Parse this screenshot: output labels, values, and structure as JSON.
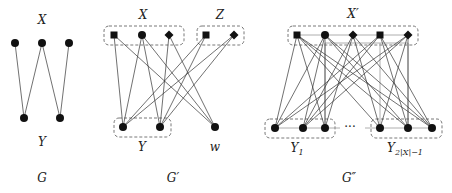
{
  "diagram": {
    "panels": [
      {
        "id": "G",
        "caption": "G",
        "set_labels": {
          "top": "X",
          "bottom": "Y"
        },
        "top_nodes": [
          {
            "x": 15,
            "y": 43,
            "shape": "circle"
          },
          {
            "x": 42,
            "y": 43,
            "shape": "circle"
          },
          {
            "x": 69,
            "y": 43,
            "shape": "circle"
          }
        ],
        "bottom_nodes": [
          {
            "x": 24,
            "y": 118,
            "shape": "circle"
          },
          {
            "x": 60,
            "y": 118,
            "shape": "circle"
          }
        ],
        "edges": [
          [
            0,
            0
          ],
          [
            1,
            0
          ],
          [
            1,
            1
          ],
          [
            2,
            1
          ]
        ]
      },
      {
        "id": "G-prime",
        "caption": "G′",
        "set_labels": {
          "X": "X",
          "Z": "Z",
          "Y": "Y",
          "w": "w"
        },
        "top_nodes": [
          {
            "x": 114,
            "y": 35,
            "shape": "square"
          },
          {
            "x": 142,
            "y": 35,
            "shape": "circle"
          },
          {
            "x": 169,
            "y": 35,
            "shape": "diamond"
          },
          {
            "x": 206,
            "y": 35,
            "shape": "square"
          },
          {
            "x": 234,
            "y": 35,
            "shape": "diamond"
          }
        ],
        "bottom_nodes": [
          {
            "x": 123,
            "y": 127,
            "shape": "circle"
          },
          {
            "x": 160,
            "y": 127,
            "shape": "circle"
          },
          {
            "x": 215,
            "y": 127,
            "shape": "circle"
          }
        ],
        "edges": [
          [
            0,
            0
          ],
          [
            0,
            2
          ],
          [
            1,
            0
          ],
          [
            1,
            1
          ],
          [
            1,
            2
          ],
          [
            2,
            1
          ],
          [
            2,
            2
          ],
          [
            3,
            0
          ],
          [
            3,
            1
          ],
          [
            4,
            0
          ],
          [
            4,
            1
          ]
        ]
      },
      {
        "id": "G-double-prime",
        "caption": "G″",
        "set_labels": {
          "top": "X′",
          "bottom_left": "Y",
          "bottom_left_sub": "1",
          "bottom_right": "Y",
          "bottom_right_sub": "2|X|−1",
          "ellipsis": "···"
        },
        "top_nodes": [
          {
            "x": 297,
            "y": 35,
            "shape": "square"
          },
          {
            "x": 325,
            "y": 35,
            "shape": "circle"
          },
          {
            "x": 353,
            "y": 35,
            "shape": "diamond"
          },
          {
            "x": 380,
            "y": 35,
            "shape": "square"
          },
          {
            "x": 408,
            "y": 35,
            "shape": "diamond"
          }
        ],
        "bottom_nodes": [
          {
            "x": 275,
            "y": 128,
            "shape": "circle"
          },
          {
            "x": 303,
            "y": 128,
            "shape": "circle"
          },
          {
            "x": 325,
            "y": 128,
            "shape": "circle"
          },
          {
            "x": 380,
            "y": 128,
            "shape": "circle"
          },
          {
            "x": 408,
            "y": 128,
            "shape": "circle"
          },
          {
            "x": 432,
            "y": 128,
            "shape": "circle"
          }
        ],
        "edges": [
          [
            0,
            0
          ],
          [
            0,
            2
          ],
          [
            1,
            0
          ],
          [
            1,
            1
          ],
          [
            1,
            2
          ],
          [
            2,
            1
          ],
          [
            2,
            2
          ],
          [
            3,
            0
          ],
          [
            3,
            1
          ],
          [
            4,
            0
          ],
          [
            4,
            1
          ],
          [
            0,
            3
          ],
          [
            0,
            5
          ],
          [
            1,
            4
          ],
          [
            1,
            5
          ],
          [
            2,
            3
          ],
          [
            2,
            5
          ],
          [
            3,
            4
          ],
          [
            3,
            5
          ],
          [
            4,
            3
          ],
          [
            4,
            4
          ],
          [
            0,
            4
          ]
        ]
      }
    ],
    "colors": {
      "ink": "#111111",
      "gray": "#9a9a9a",
      "dash": "#555555"
    }
  }
}
